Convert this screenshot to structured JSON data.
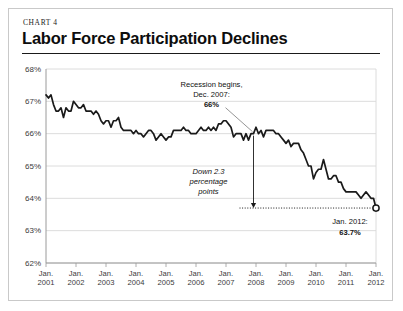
{
  "header": {
    "kicker": "CHART 4",
    "title": "Labor Force Participation Declines"
  },
  "annotations": {
    "recession_l1": "Recession begins,",
    "recession_l2": "Dec. 2007:",
    "recession_l3": "66%",
    "drop_l1": "Down 2.3",
    "drop_l2": "percentage",
    "drop_l3": "points",
    "end_l1": "Jan. 2012:",
    "end_l2": "63.7%"
  },
  "colors": {
    "line": "#1a1a1a",
    "grid": "#d8d8d8",
    "axis": "#9a9a9a",
    "text": "#333333",
    "frame": "#c9c9c9"
  },
  "chart_data": {
    "type": "line",
    "title": "Labor Force Participation Declines",
    "subtitle": "CHART 4",
    "xlabel": "",
    "ylabel": "",
    "ylim": [
      62,
      68
    ],
    "yticks": [
      62,
      63,
      64,
      65,
      66,
      67,
      68
    ],
    "ytick_labels": [
      "62%",
      "63%",
      "64%",
      "65%",
      "66%",
      "67%",
      "68%"
    ],
    "xlim": [
      "2001-01",
      "2012-01"
    ],
    "xticks": [
      "2001-01",
      "2002-01",
      "2003-01",
      "2004-01",
      "2005-01",
      "2006-01",
      "2007-01",
      "2008-01",
      "2009-01",
      "2010-01",
      "2011-01",
      "2012-01"
    ],
    "xtick_labels": [
      [
        "Jan.",
        "2001"
      ],
      [
        "Jan.",
        "2002"
      ],
      [
        "Jan.",
        "2003"
      ],
      [
        "Jan.",
        "2004"
      ],
      [
        "Jan.",
        "2005"
      ],
      [
        "Jan.",
        "2006"
      ],
      [
        "Jan.",
        "2007"
      ],
      [
        "Jan.",
        "2008"
      ],
      [
        "Jan.",
        "2009"
      ],
      [
        "Jan.",
        "2010"
      ],
      [
        "Jan.",
        "2011"
      ],
      [
        "Jan.",
        "2012"
      ]
    ],
    "grid": true,
    "legend": false,
    "series_name": "Labor force participation rate",
    "units": "percent",
    "frequency": "monthly",
    "values": [
      67.2,
      67.1,
      67.2,
      66.9,
      66.7,
      66.7,
      66.8,
      66.5,
      66.8,
      66.7,
      66.7,
      67.0,
      66.9,
      66.8,
      66.8,
      66.9,
      66.7,
      66.7,
      66.7,
      66.6,
      66.7,
      66.6,
      66.4,
      66.3,
      66.4,
      66.4,
      66.2,
      66.4,
      66.4,
      66.5,
      66.2,
      66.1,
      66.1,
      66.1,
      66.1,
      66.0,
      66.1,
      66.0,
      66.0,
      65.9,
      66.0,
      66.1,
      66.1,
      66.0,
      65.8,
      65.9,
      66.0,
      65.9,
      65.8,
      65.9,
      65.9,
      66.1,
      66.1,
      66.1,
      66.1,
      66.2,
      66.1,
      66.1,
      66.0,
      66.0,
      66.0,
      66.1,
      66.2,
      66.1,
      66.1,
      66.2,
      66.1,
      66.2,
      66.1,
      66.3,
      66.3,
      66.4,
      66.4,
      66.3,
      66.2,
      65.9,
      66.0,
      66.0,
      66.0,
      65.8,
      66.0,
      65.8,
      66.0,
      66.0,
      66.2,
      66.0,
      66.1,
      65.9,
      66.1,
      66.1,
      66.1,
      66.1,
      66.0,
      66.0,
      65.9,
      65.8,
      65.7,
      65.8,
      65.6,
      65.7,
      65.7,
      65.7,
      65.5,
      65.4,
      65.2,
      65.0,
      65.0,
      64.6,
      64.8,
      64.9,
      64.9,
      65.2,
      64.9,
      64.6,
      64.6,
      64.7,
      64.7,
      64.5,
      64.5,
      64.3,
      64.2,
      64.2,
      64.2,
      64.2,
      64.2,
      64.1,
      64.0,
      64.1,
      64.2,
      64.1,
      64.0,
      64.0,
      63.7
    ],
    "markers": [
      {
        "x": "2012-01",
        "y": 63.7,
        "label": "Jan. 2012: 63.7%",
        "style": "open-circle"
      }
    ],
    "annotations": [
      {
        "text": "Recession begins, Dec. 2007: 66%",
        "x": "2007-12",
        "y": 66.0
      },
      {
        "text": "Down 2.3 percentage points",
        "from_y": 66.0,
        "to_y": 63.7,
        "x": "2007-12"
      },
      {
        "text": "Jan. 2012: 63.7%",
        "x": "2012-01",
        "y": 63.7
      }
    ]
  }
}
